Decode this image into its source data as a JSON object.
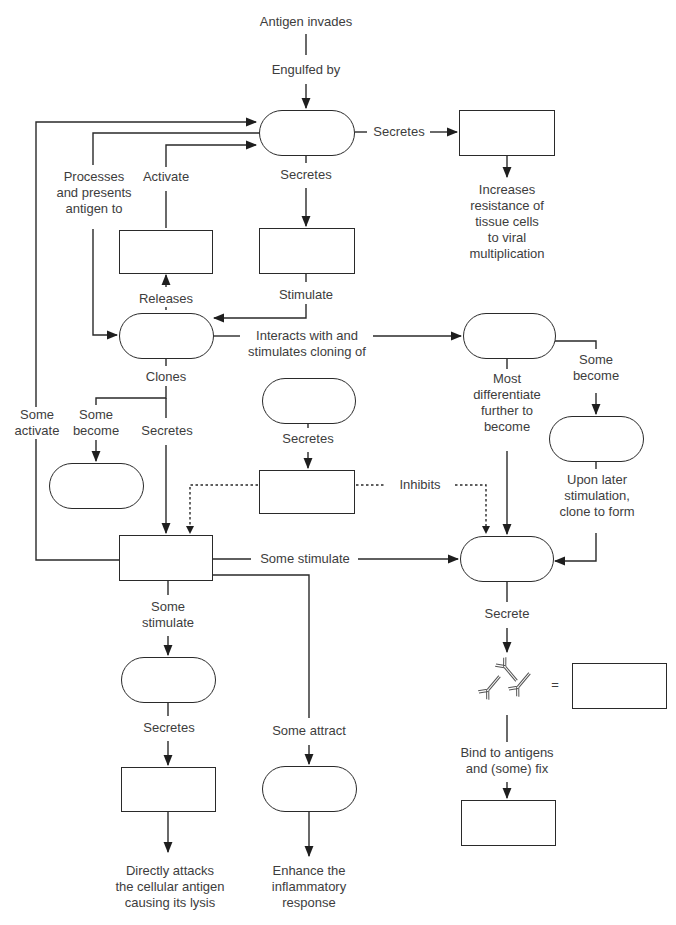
{
  "diagram": {
    "labels": {
      "antigen_invades": "Antigen invades",
      "engulfed_by": "Engulfed by",
      "secretes_right": "Secretes",
      "increases_resistance": "Increases\nresistance of\ntissue cells\nto viral\nmultiplication",
      "processes_presents": "Processes\nand presents\nantigen to",
      "activate": "Activate",
      "secretes_down": "Secretes",
      "releases": "Releases",
      "stimulate": "Stimulate",
      "interacts_with": "Interacts with and\nstimulates cloning of",
      "clones": "Clones",
      "some_activate": "Some\nactivate",
      "some_become_left": "Some\nbecome",
      "secretes_clones": "Secretes",
      "secretes_suppressor": "Secretes",
      "inhibits": "Inhibits",
      "most_differentiate": "Most\ndifferentiate\nfurther to\nbecome",
      "some_become_right": "Some\nbecome",
      "upon_later": "Upon later\nstimulation,\nclone to form",
      "some_stimulate_right": "Some stimulate",
      "some_stimulate_down": "Some\nstimulate",
      "secrete": "Secrete",
      "equals": "=",
      "bind_to_antigens": "Bind to antigens\nand (some) fix",
      "secretes_cytotoxic": "Secretes",
      "some_attract": "Some attract",
      "directly_attacks": "Directly attacks\nthe cellular antigen\ncausing its lysis",
      "enhance_inflammatory": "Enhance the\ninflammatory\nresponse"
    },
    "nodes": [
      {
        "id": "macrophage",
        "shape": "pill",
        "text": ""
      },
      {
        "id": "interferon-box",
        "shape": "box",
        "text": ""
      },
      {
        "id": "interleukin-1-box",
        "shape": "box",
        "text": ""
      },
      {
        "id": "interleukin-2-box",
        "shape": "box",
        "text": ""
      },
      {
        "id": "helper-t-cell",
        "shape": "pill",
        "text": ""
      },
      {
        "id": "b-cell",
        "shape": "pill",
        "text": ""
      },
      {
        "id": "suppressor-t-cell",
        "shape": "pill",
        "text": ""
      },
      {
        "id": "suppressor-factor-box",
        "shape": "box",
        "text": ""
      },
      {
        "id": "memory-t-cell",
        "shape": "pill",
        "text": ""
      },
      {
        "id": "memory-b-cell",
        "shape": "pill",
        "text": ""
      },
      {
        "id": "lymphokine-box",
        "shape": "box",
        "text": ""
      },
      {
        "id": "plasma-cell",
        "shape": "pill",
        "text": ""
      },
      {
        "id": "cytotoxic-t-cell",
        "shape": "pill",
        "text": ""
      },
      {
        "id": "perforin-box",
        "shape": "box",
        "text": ""
      },
      {
        "id": "inflammatory-cell",
        "shape": "pill",
        "text": ""
      },
      {
        "id": "antibodies-box",
        "shape": "box",
        "text": ""
      },
      {
        "id": "complement-box",
        "shape": "box",
        "text": ""
      }
    ],
    "colors": {
      "line": "#2a2a2a",
      "text": "#3d3d3d",
      "background": "#ffffff"
    }
  }
}
